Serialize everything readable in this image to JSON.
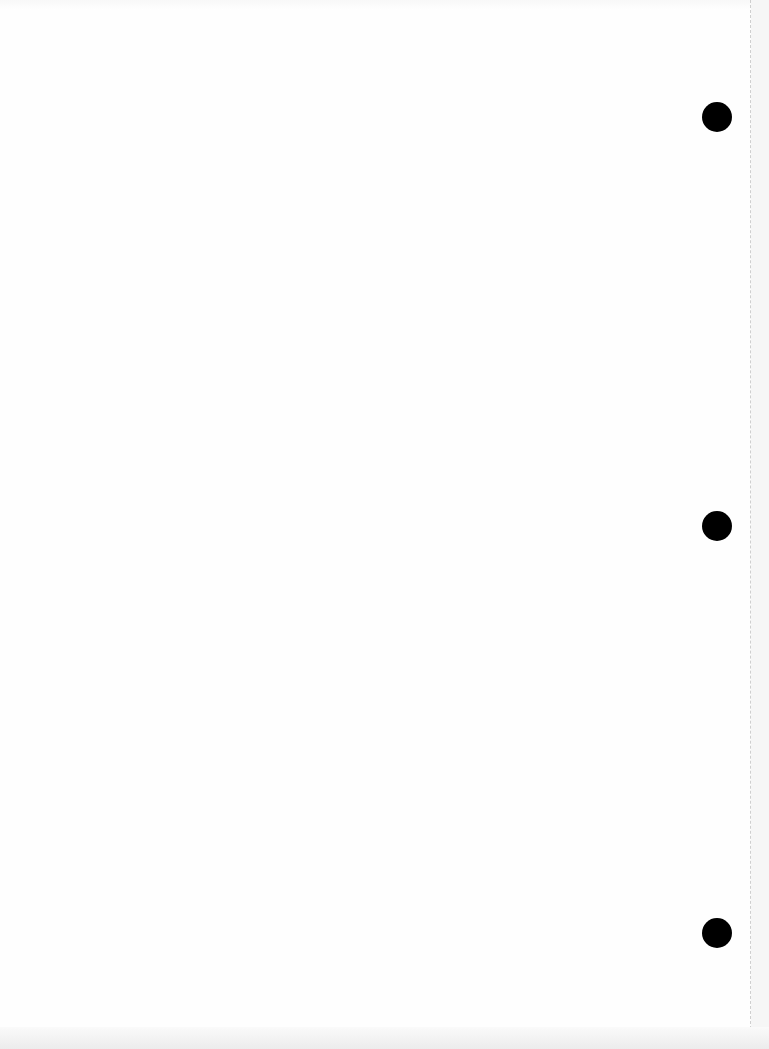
{
  "document": {
    "type": "blank scanned page",
    "text": "",
    "punch_holes": [
      {
        "x": 717,
        "y": 117,
        "diameter": 30
      },
      {
        "x": 717,
        "y": 526,
        "diameter": 30
      },
      {
        "x": 717,
        "y": 933,
        "diameter": 30
      }
    ],
    "colors": {
      "paper": "#fefefe",
      "hole": "#000000",
      "margin_line": "#cfcfcf"
    }
  }
}
